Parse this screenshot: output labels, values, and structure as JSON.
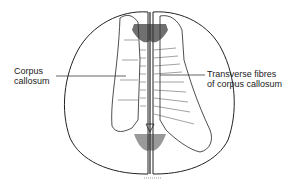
{
  "diagram": {
    "labels": {
      "left": {
        "line1": "Corpus",
        "line2": "callosum"
      },
      "right": {
        "line1": "Transverse fibres",
        "line2": "of corpus callosum"
      }
    },
    "colors": {
      "ink": "#222222",
      "background": "#ffffff"
    }
  }
}
